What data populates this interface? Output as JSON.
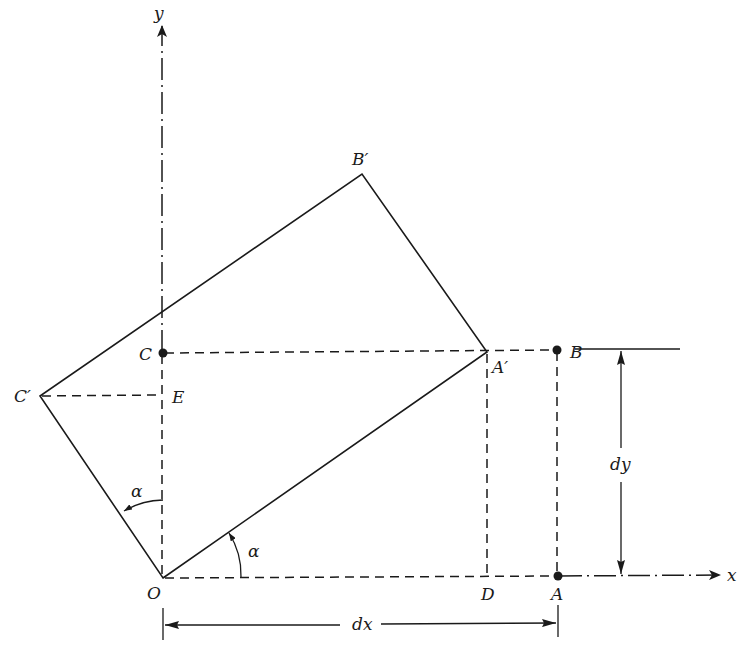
{
  "diagram": {
    "type": "geometry",
    "axes": {
      "x_label": "x",
      "y_label": "y"
    },
    "points": {
      "O": {
        "label": "O"
      },
      "A": {
        "label": "A"
      },
      "B": {
        "label": "B"
      },
      "C": {
        "label": "C"
      },
      "D": {
        "label": "D"
      },
      "E": {
        "label": "E"
      },
      "A_prime": {
        "label": "A′"
      },
      "B_prime": {
        "label": "B′"
      },
      "C_prime": {
        "label": "C′"
      }
    },
    "angles": {
      "alpha_x": {
        "label": "α"
      },
      "alpha_y": {
        "label": "α"
      }
    },
    "dimensions": {
      "dx": {
        "label": "dx"
      },
      "dy": {
        "label": "dy"
      }
    },
    "colors": {
      "ink": "#1a1a1a",
      "background": "#ffffff"
    }
  }
}
